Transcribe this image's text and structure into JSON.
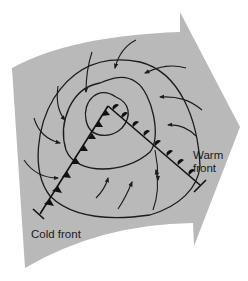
{
  "diagram": {
    "labels": {
      "cold_front": "Cold front",
      "warm_front_line1": "Warm",
      "warm_front_line2": "front"
    },
    "colors": {
      "background": "#ffffff",
      "movement_arrow_fill": "#b9b9b9",
      "ink": "#1c1c1c"
    },
    "elements": {
      "movement_arrow": "large gray arrow indicating eastward storm movement",
      "isobars_count": 3,
      "wind_arrows": "counterclockwise inflow around low center",
      "cold_front_symbol": "triangles",
      "warm_front_symbol": "semicircles"
    }
  }
}
